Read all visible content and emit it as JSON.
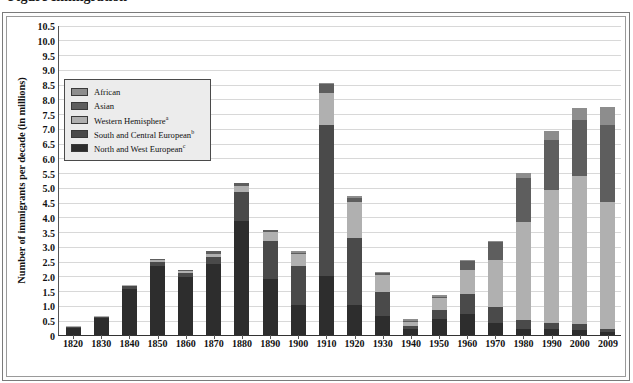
{
  "figure": {
    "clipped_title": "Figure   Immigration",
    "y_axis_title": "Number of immigrants per decade (in millions)"
  },
  "legend": {
    "items": [
      {
        "label": "African",
        "sup": "",
        "color": "#8d8d8d"
      },
      {
        "label": "Asian",
        "sup": "",
        "color": "#5e5e5e"
      },
      {
        "label": "Western Hemisphere",
        "sup": "a",
        "color": "#b0b0b0"
      },
      {
        "label": "South and Central European",
        "sup": "b",
        "color": "#4a4a4a"
      },
      {
        "label": "North and West European",
        "sup": "c",
        "color": "#2d2d2d"
      }
    ]
  },
  "chart_data": {
    "type": "bar",
    "stacked": true,
    "xlabel": "",
    "ylabel": "Number of immigrants per decade (in millions)",
    "ylim": [
      0,
      10.5
    ],
    "ytick_step": 0.5,
    "grid": true,
    "legend_position": "inside-upper-left",
    "categories": [
      "1820",
      "1830",
      "1840",
      "1850",
      "1860",
      "1870",
      "1880",
      "1890",
      "1900",
      "1910",
      "1920",
      "1930",
      "1940",
      "1950",
      "1960",
      "1970",
      "1980",
      "1990",
      "2000",
      "2009"
    ],
    "ytick_labels": [
      "0",
      "0.5",
      "1.0",
      "1.5",
      "2.0",
      "2.5",
      "3.0",
      "3.5",
      "4.0",
      "4.5",
      "5.0",
      "5.5",
      "6.0",
      "6.5",
      "7.0",
      "7.5",
      "8.0",
      "8.5",
      "9.0",
      "9.5",
      "10.0",
      "10.5"
    ],
    "series": [
      {
        "name": "North and West European",
        "color": "#2d2d2d",
        "values": [
          0.23,
          0.56,
          1.55,
          2.35,
          1.95,
          2.4,
          3.85,
          1.9,
          1.0,
          2.0,
          1.0,
          0.65,
          0.2,
          0.55,
          0.7,
          0.4,
          0.22,
          0.2,
          0.18,
          0.1
        ]
      },
      {
        "name": "South and Central European",
        "color": "#4a4a4a",
        "values": [
          0.02,
          0.04,
          0.1,
          0.14,
          0.16,
          0.25,
          1.0,
          1.3,
          1.35,
          5.1,
          2.3,
          0.8,
          0.1,
          0.3,
          0.7,
          0.55,
          0.3,
          0.22,
          0.2,
          0.12
        ]
      },
      {
        "name": "Western Hemisphere",
        "color": "#b0b0b0",
        "values": [
          0.01,
          0.02,
          0.04,
          0.06,
          0.05,
          0.08,
          0.2,
          0.3,
          0.4,
          1.1,
          1.2,
          0.6,
          0.15,
          0.4,
          0.8,
          1.6,
          3.3,
          4.5,
          5.0,
          4.3
        ]
      },
      {
        "name": "Asian",
        "color": "#5e5e5e",
        "values": [
          0.0,
          0.0,
          0.0,
          0.01,
          0.04,
          0.12,
          0.1,
          0.07,
          0.04,
          0.3,
          0.15,
          0.05,
          0.03,
          0.05,
          0.3,
          0.6,
          1.5,
          1.7,
          1.9,
          2.6
        ]
      },
      {
        "name": "African",
        "color": "#8d8d8d",
        "values": [
          0.0,
          0.0,
          0.0,
          0.0,
          0.0,
          0.0,
          0.0,
          0.0,
          0.01,
          0.05,
          0.05,
          0.02,
          0.01,
          0.02,
          0.03,
          0.05,
          0.18,
          0.28,
          0.4,
          0.6
        ]
      }
    ],
    "totals": [
      0.26,
      0.62,
      1.69,
      2.56,
      2.2,
      2.85,
      5.15,
      3.57,
      2.8,
      8.55,
      4.7,
      2.12,
      0.49,
      1.32,
      2.53,
      3.2,
      5.5,
      6.9,
      7.68,
      7.72
    ],
    "note": "Stacked bars; totals read from the vertical axis."
  }
}
